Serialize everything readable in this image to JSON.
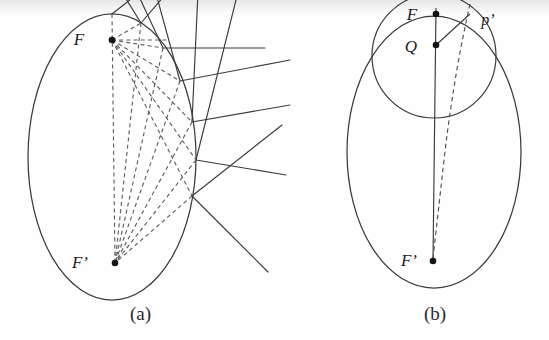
{
  "figure": {
    "width": 549,
    "height": 340,
    "background": "#fefefe",
    "stroke_color": "#3a3a3a",
    "dash_color": "#5a5a5a",
    "label_color": "#1c1c1c"
  },
  "panels": [
    {
      "id": "panel-a",
      "caption": "(a)",
      "caption_x": 130,
      "caption_y": 303,
      "description": "Ellipse with foci F and F prime, dashed focal chords reflecting between the foci, and solid tangent lines extending outward",
      "ellipse": {
        "cx": 112,
        "cy": 157,
        "rx": 84,
        "ry": 143
      },
      "points": [
        {
          "name": "F",
          "label": "F",
          "label_x": 79,
          "label_y": 45,
          "x": 112,
          "y": 40
        },
        {
          "name": "F-prime",
          "label": "F’",
          "label_x": 80,
          "label_y": 268,
          "x": 115,
          "y": 263
        }
      ],
      "reflection_points": [
        {
          "x": 112,
          "y": 14
        },
        {
          "x": 141,
          "y": 23
        },
        {
          "x": 163,
          "y": 48
        },
        {
          "x": 180,
          "y": 81
        },
        {
          "x": 192,
          "y": 122
        },
        {
          "x": 196,
          "y": 160
        },
        {
          "x": 192,
          "y": 196
        }
      ],
      "solid_line_count": 9,
      "dashed_ray_count": 14
    },
    {
      "id": "panel-b",
      "caption": "(b)",
      "caption_x": 424,
      "caption_y": 303,
      "description": "Ellipse with inner circle through F and Q, axis segment to F prime, and a dashed curve labelled p prime",
      "ellipse": {
        "cx": 434,
        "cy": 152,
        "rx": 87,
        "ry": 136
      },
      "inner_circle": {
        "cx": 434,
        "cy": 56,
        "r": 62
      },
      "points": [
        {
          "name": "F",
          "label": "F",
          "label_x": 404,
          "label_y": 20,
          "x": 436,
          "y": 14
        },
        {
          "name": "Q",
          "label": "Q",
          "label_x": 402,
          "label_y": 51,
          "x": 436,
          "y": 45
        },
        {
          "name": "F-prime",
          "label": "F’",
          "label_x": 400,
          "label_y": 266,
          "x": 433,
          "y": 261
        }
      ],
      "curve_label": {
        "name": "p-prime",
        "label": "p’",
        "label_x": 482,
        "label_y": 23
      },
      "axis_segment": {
        "x1": 436,
        "y1": 12,
        "x2": 433,
        "y2": 261
      },
      "chord_segment": {
        "x1": 436,
        "y1": 45,
        "x2": 468,
        "y2": 16
      }
    }
  ]
}
